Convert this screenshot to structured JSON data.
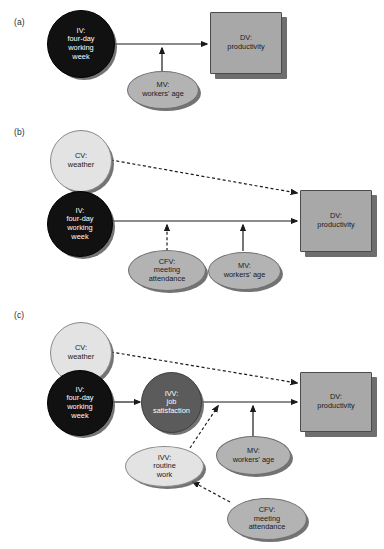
{
  "figure": {
    "background": "#ffffff",
    "colors": {
      "iv_fill": "#111111",
      "ivv_fill": "#5b5b5b",
      "cv_fill": "#e3e3e3",
      "mv_fill": "#b3b3b3",
      "cfv_fill": "#b3b3b3",
      "dv_fill": "#a8a8a8",
      "shadow": "#6e6e6e",
      "edge": "#1a1a1a"
    }
  },
  "panels": [
    {
      "id": "a",
      "label": "(a)",
      "nodes": {
        "iv": "IV:\nfour-day\nworking\nweek",
        "dv": "DV:\nproductivity",
        "mv": "MV:\nworkers' age"
      },
      "edges": [
        {
          "from": "iv",
          "to": "dv",
          "style": "solid"
        },
        {
          "from": "mv",
          "to": "iv-dv-path",
          "style": "solid"
        }
      ]
    },
    {
      "id": "b",
      "label": "(b)",
      "nodes": {
        "cv": "CV:\nweather",
        "iv": "IV:\nfour-day\nworking\nweek",
        "dv": "DV:\nproductivity",
        "cfv": "CFV:\nmeeting\nattendance",
        "mv": "MV:\nworkers' age"
      },
      "edges": [
        {
          "from": "cv",
          "to": "dv",
          "style": "dashed"
        },
        {
          "from": "iv",
          "to": "dv",
          "style": "solid"
        },
        {
          "from": "cfv",
          "to": "iv-dv-path",
          "style": "dashed"
        },
        {
          "from": "mv",
          "to": "iv-dv-path",
          "style": "solid"
        }
      ]
    },
    {
      "id": "c",
      "label": "(c)",
      "nodes": {
        "cv": "CV:\nweather",
        "iv": "IV:\nfour-day\nworking\nweek",
        "ivv_job": "IVV:\njob\nsatisfaction",
        "dv": "DV:\nproductivity",
        "ivv_routine": "IVV:\nroutine\nwork",
        "mv": "MV:\nworkers' age",
        "cfv": "CFV:\nmeeting\nattendance"
      },
      "edges": [
        {
          "from": "cv",
          "to": "dv",
          "style": "dashed"
        },
        {
          "from": "iv",
          "to": "ivv_job",
          "style": "solid"
        },
        {
          "from": "ivv_job",
          "to": "dv",
          "style": "solid"
        },
        {
          "from": "ivv_routine",
          "to": "ivv_job-dv-path",
          "style": "dashed"
        },
        {
          "from": "mv",
          "to": "ivv_job-dv-path",
          "style": "solid"
        },
        {
          "from": "cfv",
          "to": "ivv_routine",
          "style": "dashed"
        }
      ]
    }
  ]
}
